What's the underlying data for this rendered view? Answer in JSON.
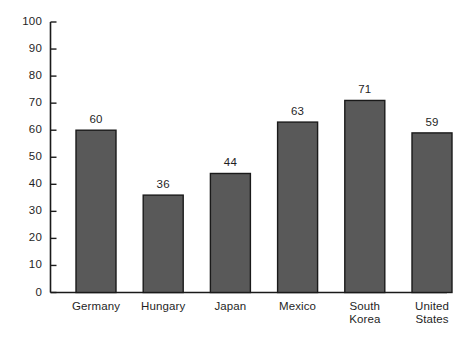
{
  "chart_data": {
    "type": "bar",
    "title": "",
    "subtitle": "",
    "xlabel": "",
    "ylabel": "",
    "ylim": [
      0,
      100
    ],
    "ytick_step": 10,
    "yticks": [
      "0",
      "10",
      "20",
      "30",
      "40",
      "50",
      "60",
      "70",
      "80",
      "90",
      "100"
    ],
    "grid": false,
    "legend": false,
    "legend_position": "none",
    "categories": [
      "Germany",
      "Hungary",
      "Japan",
      "Mexico",
      "South Korea",
      "United States"
    ],
    "category_lines": [
      [
        "Germany"
      ],
      [
        "Hungary"
      ],
      [
        "Japan"
      ],
      [
        "Mexico"
      ],
      [
        "South",
        "Korea"
      ],
      [
        "United",
        "States"
      ]
    ],
    "values": [
      60,
      36,
      44,
      63,
      71,
      59
    ],
    "value_labels": [
      "60",
      "36",
      "44",
      "63",
      "71",
      "59"
    ],
    "bar_fill_color": "#595959",
    "bar_edge_color": "#1a1a1a",
    "axis_color": "#1a1a1a",
    "background_color": "#ffffff",
    "text_color": "#1f1f1f"
  }
}
